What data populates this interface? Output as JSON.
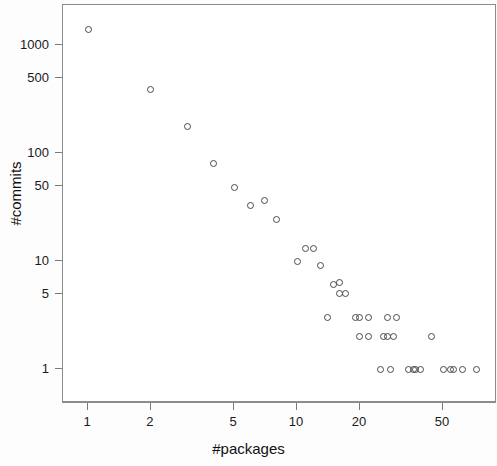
{
  "chart_data": {
    "type": "scatter",
    "title": "",
    "xlabel": "#packages",
    "ylabel": "#commits",
    "xscale": "log",
    "yscale": "log",
    "xlim": [
      0.82,
      85
    ],
    "ylim": [
      0.75,
      2000
    ],
    "grid": false,
    "legend": null,
    "xticks": [
      1,
      2,
      5,
      10,
      20,
      50
    ],
    "xticklabels": [
      "1",
      "2",
      "5",
      "10",
      "20",
      "50"
    ],
    "yticks": [
      1,
      5,
      10,
      50,
      100,
      500,
      1000
    ],
    "yticklabels": [
      "1",
      "5",
      "10",
      "50",
      "100",
      "500",
      "1000"
    ],
    "marker": "open-circle",
    "marker_color": "#4a4a4a",
    "points": [
      {
        "x": 1,
        "y": 1400
      },
      {
        "x": 2,
        "y": 390
      },
      {
        "x": 3,
        "y": 175
      },
      {
        "x": 4,
        "y": 80
      },
      {
        "x": 5,
        "y": 48
      },
      {
        "x": 6,
        "y": 33
      },
      {
        "x": 7,
        "y": 36
      },
      {
        "x": 8,
        "y": 24
      },
      {
        "x": 10,
        "y": 10
      },
      {
        "x": 11,
        "y": 13
      },
      {
        "x": 12,
        "y": 13
      },
      {
        "x": 13,
        "y": 9
      },
      {
        "x": 15,
        "y": 6
      },
      {
        "x": 16,
        "y": 6.3
      },
      {
        "x": 16,
        "y": 5
      },
      {
        "x": 17,
        "y": 5
      },
      {
        "x": 14,
        "y": 3
      },
      {
        "x": 19,
        "y": 3
      },
      {
        "x": 20,
        "y": 3
      },
      {
        "x": 22,
        "y": 3
      },
      {
        "x": 27,
        "y": 3
      },
      {
        "x": 30,
        "y": 3
      },
      {
        "x": 20,
        "y": 2
      },
      {
        "x": 22,
        "y": 2
      },
      {
        "x": 26,
        "y": 2
      },
      {
        "x": 27,
        "y": 2
      },
      {
        "x": 29,
        "y": 2
      },
      {
        "x": 44,
        "y": 2
      },
      {
        "x": 25,
        "y": 1
      },
      {
        "x": 28,
        "y": 1
      },
      {
        "x": 34,
        "y": 1
      },
      {
        "x": 36,
        "y": 1
      },
      {
        "x": 37,
        "y": 1
      },
      {
        "x": 39,
        "y": 1
      },
      {
        "x": 50,
        "y": 1
      },
      {
        "x": 54,
        "y": 1
      },
      {
        "x": 56,
        "y": 1
      },
      {
        "x": 62,
        "y": 1
      },
      {
        "x": 72,
        "y": 1
      }
    ]
  },
  "axes": {
    "x_title": "#packages",
    "y_title": "#commits"
  }
}
